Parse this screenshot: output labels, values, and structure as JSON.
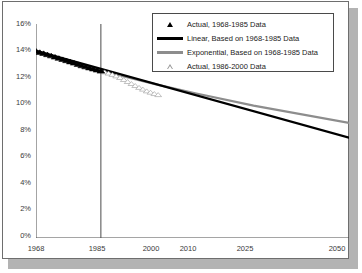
{
  "chart_data": {
    "type": "line",
    "title": "",
    "subtitle": "",
    "xlabel": "",
    "ylabel": "",
    "xlim": [
      1968,
      2050
    ],
    "ylim": [
      0,
      16
    ],
    "ytick_labels": [
      "0%",
      "2%",
      "4%",
      "6%",
      "8%",
      "10%",
      "12%",
      "14%",
      "16%"
    ],
    "ytick_values": [
      0,
      2,
      4,
      6,
      8,
      10,
      12,
      14,
      16
    ],
    "xtick_labels": [
      "1968",
      "1985",
      "2000",
      "2010",
      "2025",
      "2050"
    ],
    "xtick_values": [
      1968,
      1985,
      2000,
      2010,
      2025,
      2050
    ],
    "grid": false,
    "legend_position": "top-right",
    "annotations": [
      {
        "type": "vertical-line",
        "x": 1985,
        "label": "1985"
      }
    ],
    "series": [
      {
        "name": "Actual, 1968-1985 Data",
        "type": "scatter",
        "marker": "filled-triangle",
        "color": "#000000",
        "x": [
          1968,
          1969,
          1970,
          1971,
          1972,
          1973,
          1974,
          1975,
          1976,
          1977,
          1978,
          1979,
          1980,
          1981,
          1982,
          1983,
          1984,
          1985
        ],
        "values": [
          14.0,
          13.9,
          13.82,
          13.73,
          13.64,
          13.55,
          13.46,
          13.37,
          13.28,
          13.19,
          13.1,
          13.0,
          12.9,
          12.82,
          12.74,
          12.66,
          12.58,
          12.5
        ]
      },
      {
        "name": "Linear, Based on 1968-1985 Data",
        "type": "line",
        "color": "#000000",
        "x": [
          1968,
          2050
        ],
        "values": [
          14.0,
          7.5
        ]
      },
      {
        "name": "Exponential, Based on 1968-1985 Data",
        "type": "line",
        "color": "#8d8d8d",
        "x": [
          1968,
          1985,
          2000,
          2010,
          2025,
          2050
        ],
        "values": [
          14.0,
          12.5,
          11.45,
          10.8,
          9.9,
          8.6
        ]
      },
      {
        "name": "Actual, 1986-2000 Data",
        "type": "scatter",
        "marker": "hollow-triangle",
        "color": "#9a9a9a",
        "x": [
          1986,
          1987,
          1988,
          1989,
          1990,
          1991,
          1992,
          1993,
          1994,
          1995,
          1996,
          1997,
          1998,
          1999,
          2000
        ],
        "values": [
          12.42,
          12.33,
          12.23,
          12.12,
          12.0,
          11.85,
          11.7,
          11.55,
          11.4,
          11.26,
          11.13,
          11.0,
          10.9,
          10.8,
          10.72
        ]
      }
    ]
  },
  "legend": {
    "items": [
      {
        "label": "Actual, 1968-1985 Data",
        "key": "filled-triangle"
      },
      {
        "label": "Linear, Based on 1968-1985 Data",
        "key": "black-line"
      },
      {
        "label": "Exponential, Based on 1968-1985 Data",
        "key": "gray-line"
      },
      {
        "label": "Actual, 1986-2000 Data",
        "key": "hollow-triangle"
      }
    ]
  },
  "axes": {
    "y_labels": [
      "16%",
      "14%",
      "12%",
      "10%",
      "8%",
      "6%",
      "4%",
      "2%",
      "0%"
    ],
    "x_labels": [
      "1968",
      "1985",
      "2000",
      "2010",
      "2025",
      "2050"
    ]
  }
}
